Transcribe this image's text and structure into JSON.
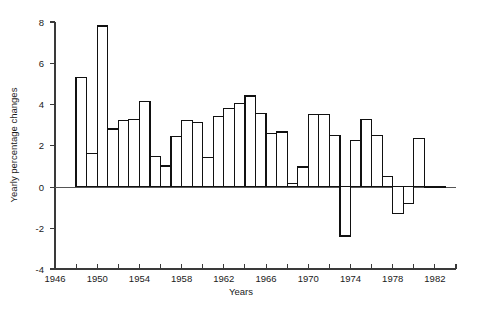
{
  "chart_data": {
    "type": "bar",
    "title": "",
    "subtitle": "",
    "xlabel": "Years",
    "ylabel": "Yearly percentage changes",
    "xlim": [
      1946,
      1984
    ],
    "ylim": [
      -4,
      8
    ],
    "grid": false,
    "legend": null,
    "annotations": [],
    "x_major_ticks": [
      1946,
      1950,
      1954,
      1958,
      1962,
      1966,
      1970,
      1974,
      1978,
      1982
    ],
    "x_minor_ticks": [
      1948,
      1952,
      1956,
      1960,
      1964,
      1968,
      1972,
      1976,
      1980,
      1984
    ],
    "x_tick_labels": [
      "1946",
      "1950",
      "1954",
      "1958",
      "1962",
      "1966",
      "1970",
      "1974",
      "1978",
      "1982"
    ],
    "y_ticks": [
      -4,
      -2,
      0,
      2,
      4,
      6,
      8
    ],
    "y_tick_labels": [
      "-4",
      "-2",
      "0",
      "2",
      "4",
      "6",
      "8"
    ],
    "bar_style": "outlined",
    "bar_fill": "#ffffff",
    "bar_stroke": "#111111",
    "categories": [
      1948,
      1949,
      1950,
      1951,
      1952,
      1953,
      1954,
      1955,
      1956,
      1957,
      1958,
      1959,
      1960,
      1961,
      1962,
      1963,
      1964,
      1965,
      1966,
      1967,
      1968,
      1969,
      1970,
      1971,
      1972,
      1973,
      1974,
      1975,
      1976,
      1977,
      1978,
      1979,
      1980,
      1981,
      1982
    ],
    "values": [
      5.3,
      1.6,
      7.8,
      2.8,
      3.2,
      3.25,
      4.15,
      1.45,
      1.0,
      2.45,
      3.2,
      3.1,
      1.4,
      3.4,
      3.8,
      4.05,
      4.4,
      3.55,
      2.6,
      2.65,
      0.15,
      0.95,
      3.5,
      3.5,
      2.5,
      -2.4,
      2.25,
      3.25,
      2.5,
      0.5,
      -1.3,
      -0.8,
      2.35,
      -0.05,
      0.0
    ]
  },
  "axis": {
    "ylabel": "Yearly percentage changes",
    "xlabel": "Years"
  }
}
